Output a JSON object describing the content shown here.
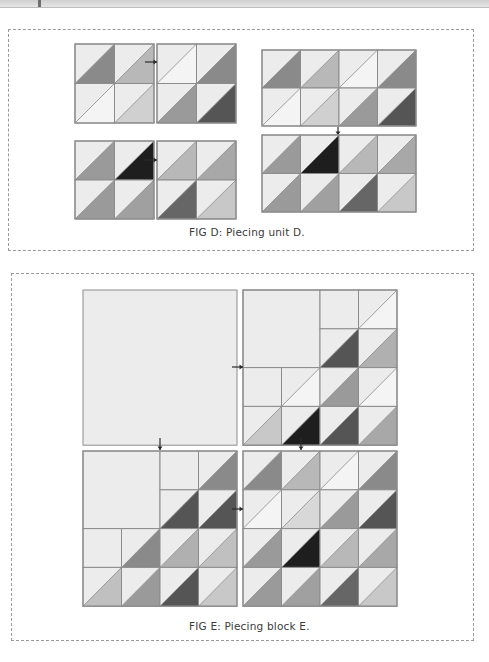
{
  "figures": [
    {
      "id": "D",
      "caption": "FIG D: Piecing unit D.",
      "units": [
        {
          "name": "unit-a",
          "rows": [
            [
              "#8a8a8a",
              "#b8b8b8"
            ],
            [
              "#f4f4f4",
              "#d0d0d0"
            ]
          ]
        },
        {
          "name": "unit-b",
          "rows": [
            [
              "#f4f4f4",
              "#8a8a8a"
            ],
            [
              "#9a9a9a",
              "#555555"
            ]
          ]
        },
        {
          "name": "unit-ab-joined",
          "rows": [
            [
              "#8a8a8a",
              "#b8b8b8",
              "#f4f4f4",
              "#8a8a8a"
            ],
            [
              "#f4f4f4",
              "#d0d0d0",
              "#9a9a9a",
              "#555555"
            ]
          ]
        },
        {
          "name": "unit-c",
          "rows": [
            [
              "#9a9a9a",
              "#1e1e1e"
            ],
            [
              "#9a9a9a",
              "#a0a0a0"
            ]
          ]
        },
        {
          "name": "unit-d",
          "rows": [
            [
              "#b8b8b8",
              "#a8a8a8"
            ],
            [
              "#666666",
              "#c8c8c8"
            ]
          ]
        },
        {
          "name": "unit-cd-joined",
          "rows": [
            [
              "#9a9a9a",
              "#1e1e1e",
              "#b8b8b8",
              "#a8a8a8"
            ],
            [
              "#9a9a9a",
              "#a0a0a0",
              "#666666",
              "#c8c8c8"
            ]
          ]
        }
      ]
    },
    {
      "id": "E",
      "caption": "FIG E: Piecing block E.",
      "blocks": [
        {
          "name": "plain-square-block",
          "rows": [
            [
              null,
              null,
              null,
              null
            ],
            [
              null,
              null,
              null,
              null
            ],
            [
              null,
              null,
              null,
              null
            ],
            [
              null,
              null,
              null,
              null
            ]
          ],
          "plain_all": true
        },
        {
          "name": "stair-block-top",
          "rows": [
            [
              "X",
              "X",
              "P",
              "#f4f4f4"
            ],
            [
              "X",
              "X",
              "#555555",
              "#b0b0b0"
            ],
            [
              "P",
              "#f4f4f4",
              "#9a9a9a",
              "#f4f4f4"
            ],
            [
              "#c8c8c8",
              "#1e1e1e",
              "#555555",
              "#a8a8a8"
            ]
          ]
        },
        {
          "name": "stair-block-bottom",
          "rows": [
            [
              "X",
              "X",
              "P",
              "#8a8a8a"
            ],
            [
              "X",
              "X",
              "#555555",
              "#555555"
            ],
            [
              "P",
              "#8a8a8a",
              "#b0b0b0",
              "#c0c0c0"
            ],
            [
              "#c0c0c0",
              "#9a9a9a",
              "#555555",
              "#c8c8c8"
            ]
          ]
        },
        {
          "name": "full-hst-block",
          "rows": [
            [
              "#8a8a8a",
              "#b8b8b8",
              "#f4f4f4",
              "#8a8a8a"
            ],
            [
              "#f4f4f4",
              "#d8d8d8",
              "#9a9a9a",
              "#555555"
            ],
            [
              "#9a9a9a",
              "#1e1e1e",
              "#b8b8b8",
              "#a8a8a8"
            ],
            [
              "#9a9a9a",
              "#a0a0a0",
              "#666666",
              "#c8c8c8"
            ]
          ]
        }
      ]
    }
  ],
  "colors": {
    "background_triangle": "#ececec",
    "plain_fabric": "#ececec",
    "seam": "#8c8c8c",
    "arrow": "#2a2a2a"
  }
}
